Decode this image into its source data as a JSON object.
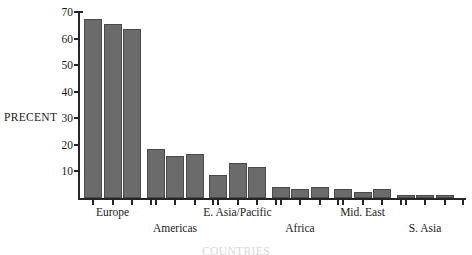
{
  "chart_data": {
    "type": "bar",
    "title": "",
    "xlabel": "COUNTRIES",
    "ylabel": "PRECENT",
    "ylim": [
      0,
      70
    ],
    "y_ticks": [
      10,
      20,
      30,
      40,
      50,
      60,
      70
    ],
    "grid": false,
    "legend": "none",
    "categories": [
      "Europe",
      "Americas",
      "E. Asia/Pacific",
      "Africa",
      "Mid. East",
      "S. Asia"
    ],
    "bars_per_category": 3,
    "series": [
      {
        "name": "bar-1",
        "values": [
          67.5,
          18.5,
          8.7,
          4.0,
          3.3,
          1.0
        ]
      },
      {
        "name": "bar-2",
        "values": [
          65.5,
          15.8,
          13.0,
          3.3,
          2.3,
          1.0
        ]
      },
      {
        "name": "bar-3",
        "values": [
          63.5,
          16.5,
          11.8,
          4.2,
          3.3,
          1.0
        ]
      }
    ],
    "colors": {
      "bar_fill": "#6b6b6b",
      "bar_stroke": "#4a4a4a",
      "axis": "#262626",
      "background": "#ffffff",
      "text": "#1a1a1a"
    }
  },
  "axis": {
    "y_label": "PRECENT",
    "x_title": "COUNTRIES",
    "y_tick_labels": [
      "10",
      "20",
      "30",
      "40",
      "50",
      "60",
      "70"
    ]
  },
  "category_labels": [
    {
      "text": "Europe",
      "row": 0
    },
    {
      "text": "Americas",
      "row": 1
    },
    {
      "text": "E. Asia/Pacific",
      "row": 0
    },
    {
      "text": "Africa",
      "row": 1
    },
    {
      "text": "Mid. East",
      "row": 0
    },
    {
      "text": "S. Asia",
      "row": 1
    }
  ]
}
